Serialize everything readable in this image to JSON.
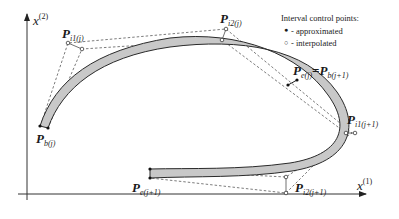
{
  "axes": {
    "x_label_base": "x",
    "x_label_sup": "(1)",
    "y_label_base": "x",
    "y_label_sup": "(2)"
  },
  "legend": {
    "title": "Interval control points:",
    "items": [
      {
        "marker": "●",
        "label": "- approximated"
      },
      {
        "marker": "○",
        "label": "- interpolated"
      }
    ]
  },
  "points": {
    "pi1j": {
      "base": "P",
      "sub": "i1(j)"
    },
    "pi2j": {
      "base": "P",
      "sub": "i2(j)"
    },
    "pej": {
      "base": "P",
      "sub": "e(j)"
    },
    "eq": "=",
    "pbj1": {
      "base": "P",
      "sub": "b(j+1)"
    },
    "pi1j1": {
      "base": "P",
      "sub": "i1(j+1)"
    },
    "pbj": {
      "base": "P",
      "sub": "b(j)"
    },
    "pej1": {
      "base": "P",
      "sub": "e(j+1)"
    },
    "pi2j1": {
      "base": "P",
      "sub": "i2(j+1)"
    }
  },
  "colors": {
    "band_fill": "#c8c8c8",
    "stroke": "#2a2a2a",
    "dashed": "#444444"
  }
}
